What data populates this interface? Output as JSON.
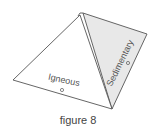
{
  "diagram": {
    "caption": "figure 8",
    "faces": [
      {
        "label": "Igneous",
        "fill": "#ffffff"
      },
      {
        "label": "Sedimentary",
        "fill": "#e8e8e8"
      }
    ],
    "stroke_color": "#555555"
  }
}
